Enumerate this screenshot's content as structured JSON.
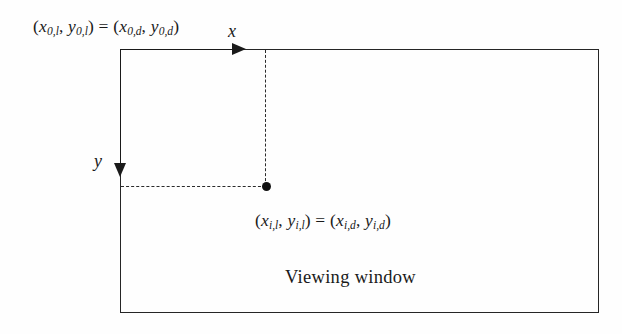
{
  "figure": {
    "type": "diagram",
    "background_color": "#fefefe",
    "line_color": "#1a1a1a"
  },
  "labels": {
    "origin_equation": {
      "parts": {
        "open_paren": "(",
        "x_left": "x",
        "x_left_sub": "0,l",
        "comma1": ", ",
        "y_left": "y",
        "y_left_sub": "0,l",
        "close_paren": ")",
        "equals": " = ",
        "open_paren2": "(",
        "x_right": "x",
        "x_right_sub": "0,d",
        "comma2": ", ",
        "y_right": "y",
        "y_right_sub": "0,d",
        "close_paren2": ")"
      },
      "plain": "(x0,l, y0,l) = (x0,d, y0,d)"
    },
    "point_equation": {
      "parts": {
        "open_paren": "(",
        "x_left": "x",
        "x_left_sub": "i,l",
        "comma1": ", ",
        "y_left": "y",
        "y_left_sub": "i,l",
        "close_paren": ")",
        "equals": " = ",
        "open_paren2": "(",
        "x_right": "x",
        "x_right_sub": "i,d",
        "comma2": ", ",
        "y_right": "y",
        "y_right_sub": "i,d",
        "close_paren2": ")"
      },
      "plain": "(xi,l, yi,l) = (xi,d, yi,d)"
    },
    "x_axis_letter": "x",
    "y_axis_letter": "y",
    "window_caption": "Viewing window"
  }
}
